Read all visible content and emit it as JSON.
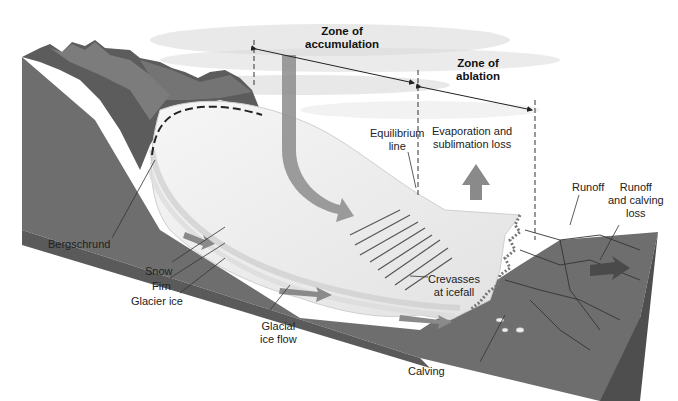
{
  "diagram": {
    "zones": {
      "accumulation": {
        "line1": "Zone of",
        "line2": "accumulation"
      },
      "ablation": {
        "line1": "Zone of",
        "line2": "ablation"
      }
    },
    "labels": {
      "equilibrium_line": {
        "line1": "Equilibrium",
        "line2": "line"
      },
      "evaporation": {
        "line1": "Evaporation and",
        "line2": "sublimation loss"
      },
      "runoff": "Runoff",
      "runoff_calving": {
        "line1": "Runoff",
        "line2": "and calving",
        "line3": "loss"
      },
      "bergschrund": "Bergschrund",
      "snow": "Snow",
      "firn": "Firn",
      "glacier_ice": "Glacier ice",
      "glacial_ice_flow": {
        "line1": "Glacial",
        "line2": "ice flow"
      },
      "crevasses": {
        "line1": "Crevasses",
        "line2": "at icefall"
      },
      "calving": "Calving"
    },
    "colors": {
      "bedrock": "#6e6e6e",
      "bedrock_dark": "#555555",
      "ice": "#ededed",
      "ice_edge": "#d8d8d8",
      "arrow": "#8a8a8a",
      "text": "#222222"
    }
  }
}
